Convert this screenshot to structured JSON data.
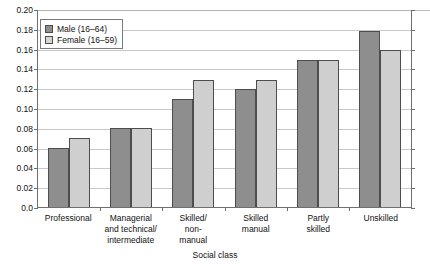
{
  "chart_data": {
    "type": "bar",
    "title": "",
    "subtitle": "",
    "xlabel": "Social class",
    "ylabel": "",
    "ylim": [
      0.0,
      0.2
    ],
    "ytick_labels": [
      "0.20",
      "0.18",
      "0.16",
      "0.14",
      "0.12",
      "0.10",
      "0.08",
      "0.06",
      "0.04",
      "0.02",
      "0.0"
    ],
    "ytick_values": [
      0.2,
      0.18,
      0.16,
      0.14,
      0.12,
      0.1,
      0.08,
      0.06,
      0.04,
      0.02,
      0.0
    ],
    "grid": true,
    "legend_position": "top-left",
    "categories": [
      "Professional",
      "Managerial and technical/ intermediate",
      "Skilled/ non- manual",
      "Skilled manual",
      "Partly skilled",
      "Unskilled"
    ],
    "category_lines": [
      [
        "Professional"
      ],
      [
        "Managerial",
        "and technical/",
        "intermediate"
      ],
      [
        "Skilled/",
        "non-",
        "manual"
      ],
      [
        "Skilled",
        "manual"
      ],
      [
        "Partly",
        "skilled"
      ],
      [
        "Unskilled"
      ]
    ],
    "series": [
      {
        "name": "Male (16–64)",
        "color": "#8e8e8e",
        "values": [
          0.06,
          0.08,
          0.109,
          0.119,
          0.149,
          0.178
        ]
      },
      {
        "name": "Female (16–59)",
        "color": "#cfcfcf",
        "values": [
          0.07,
          0.08,
          0.128,
          0.128,
          0.149,
          0.159
        ]
      }
    ]
  },
  "legend": {
    "items": [
      {
        "label": "Male (16–64)",
        "swatch": "male"
      },
      {
        "label": "Female (16–59)",
        "swatch": "female"
      }
    ]
  },
  "axis": {
    "x_title": "Social class"
  },
  "colors": {
    "male_bar": "#8e8e8e",
    "female_bar": "#cfcfcf",
    "bar_border": "#4d4d4d",
    "gridline": "#c9c9c9",
    "axis": "#6f6f6f",
    "background": "#ffffff",
    "text": "#111111"
  }
}
